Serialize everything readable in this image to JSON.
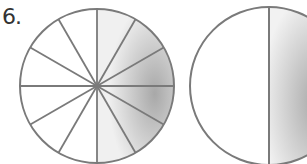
{
  "problem": {
    "number": "6.",
    "figures": [
      {
        "type": "circle",
        "parts": 12,
        "shaded_parts": 6,
        "shaded_side": "right"
      },
      {
        "type": "circle",
        "parts": 2,
        "shaded_parts": 1,
        "shaded_side": "right"
      }
    ]
  },
  "colors": {
    "stroke": "#7a7a7a",
    "shade_light": "#f2f2f2",
    "shade_dark": "#b0b0b0"
  }
}
